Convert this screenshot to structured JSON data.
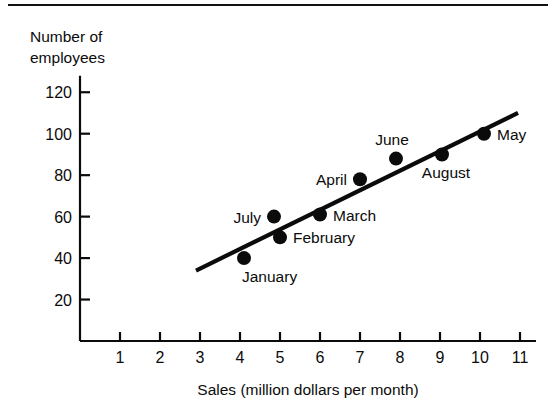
{
  "figure": {
    "has_top_rule": true,
    "background_color": "#ffffff",
    "ink_color": "#0b0b0b"
  },
  "chart_data": {
    "type": "scatter",
    "title": "",
    "subtitle": "",
    "xlabel": "Sales (million dollars per month)",
    "ylabel": "Number of employees",
    "ylabel_lines": [
      "Number of",
      "employees"
    ],
    "xlim": [
      0,
      11.4
    ],
    "ylim": [
      0,
      128
    ],
    "xticks": [
      1,
      2,
      3,
      4,
      5,
      6,
      7,
      8,
      9,
      10,
      11
    ],
    "xtick_labels": [
      "1",
      "2",
      "3",
      "4",
      "5",
      "6",
      "7",
      "8",
      "9",
      "10",
      "11"
    ],
    "yticks": [
      20,
      40,
      60,
      80,
      100,
      120
    ],
    "ytick_labels": [
      "20",
      "40",
      "60",
      "80",
      "100",
      "120"
    ],
    "grid": false,
    "legend": "none",
    "marker": "filled-circle",
    "marker_color": "#0b0b0b",
    "points": [
      {
        "label": "January",
        "x": 4.1,
        "y": 40,
        "label_pos": "below-right"
      },
      {
        "label": "February",
        "x": 5.0,
        "y": 50,
        "label_pos": "right"
      },
      {
        "label": "March",
        "x": 6.0,
        "y": 61,
        "label_pos": "right"
      },
      {
        "label": "April",
        "x": 7.0,
        "y": 78,
        "label_pos": "left"
      },
      {
        "label": "May",
        "x": 10.1,
        "y": 100,
        "label_pos": "right"
      },
      {
        "label": "June",
        "x": 7.9,
        "y": 88,
        "label_pos": "above-left"
      },
      {
        "label": "July",
        "x": 4.85,
        "y": 60,
        "label_pos": "left"
      },
      {
        "label": "August",
        "x": 9.05,
        "y": 90,
        "label_pos": "below-left"
      }
    ],
    "trend_line": {
      "description": "fitted straight line",
      "x_start": 2.9,
      "y_start": 34,
      "x_end": 10.95,
      "y_end": 110
    }
  }
}
